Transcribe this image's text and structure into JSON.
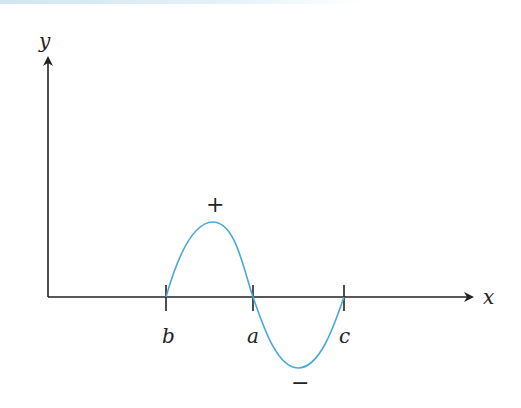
{
  "diagram": {
    "axes": {
      "x_label": "x",
      "y_label": "y"
    },
    "ticks": [
      {
        "label": "b"
      },
      {
        "label": "a"
      },
      {
        "label": "c"
      }
    ],
    "region_signs": {
      "positive": "+",
      "negative": "−"
    },
    "colors": {
      "curve": "#4aa8d8",
      "axis": "#222222"
    }
  }
}
